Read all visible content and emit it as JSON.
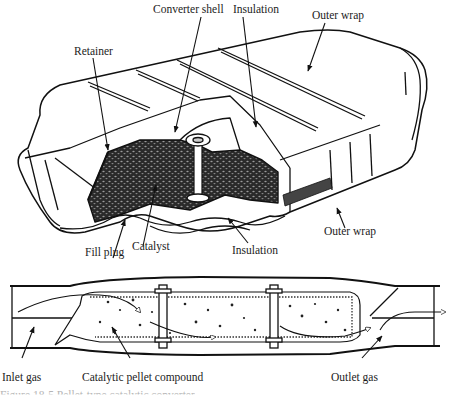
{
  "figure": {
    "top_view": {
      "title": "Pellet-type catalytic converter cutaway",
      "labels": {
        "converter_shell": "Converter shell",
        "insulation_top": "Insulation",
        "outer_wrap_top": "Outer wrap",
        "retainer": "Retainer",
        "fill_plug": "Fill plug",
        "catalyst": "Catalyst",
        "insulation_bottom": "Insulation",
        "outer_wrap_bottom": "Outer wrap"
      }
    },
    "cross_section": {
      "labels": {
        "inlet_gas": "Inlet gas",
        "pellet_compound": "Catalytic pellet compound",
        "outlet_gas": "Outlet gas"
      }
    },
    "caption_fragment": "Figure 18-5  Pellet-type catalytic converter"
  },
  "colors": {
    "ink": "#1a1a1a",
    "paper": "#ffffff",
    "caption": "#b5b5b5"
  }
}
